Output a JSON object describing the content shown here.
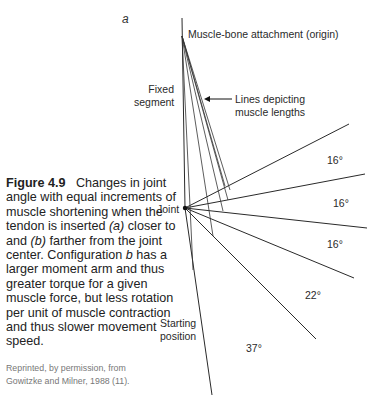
{
  "panel_label": "a",
  "labels": {
    "origin": "Muscle-bone attachment (origin)",
    "fixed_segment_line1": "Fixed",
    "fixed_segment_line2": "segment",
    "muscle_lines_line1": "Lines depicting",
    "muscle_lines_line2": "muscle lengths",
    "joint": "Joint",
    "starting_line1": "Starting",
    "starting_line2": "position"
  },
  "angles": [
    "16°",
    "16°",
    "16°",
    "22°",
    "37°"
  ],
  "caption": {
    "figure_number": "Figure 4.9",
    "text_part1": "Changes in joint angle with equal increments of muscle shortening when the tendon is inserted ",
    "a": "(a)",
    "text_part2": " closer to and ",
    "b": "(b)",
    "text_part3": " farther from the joint center. Configuration ",
    "b_plain": "b",
    "text_part4": " has a larger moment arm and thus greater torque for a given muscle force, but less rotation per unit of muscle contraction and thus slower movement speed."
  },
  "credit": {
    "line1": "Reprinted, by permission, from",
    "line2": "Gowitzke and Milner, 1988 (11)."
  }
}
